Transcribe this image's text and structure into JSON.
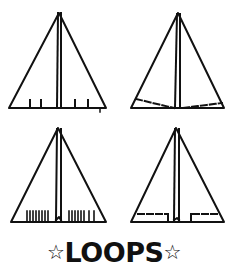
{
  "title": {
    "text": "LOOPS",
    "left_symbol": "☆",
    "right_symbol": "☆"
  },
  "diagrams": [
    {
      "id": 1,
      "description": "paper airplane with four short flap cuts at trailing edge"
    },
    {
      "id": 2,
      "description": "paper airplane with dashed diagonal fold lines at trailing edge"
    },
    {
      "id": 3,
      "description": "paper airplane with many closely spaced cuts at trailing edge"
    },
    {
      "id": 4,
      "description": "paper airplane with dashed rectangular flap fold lines at trailing edge"
    }
  ],
  "colors": {
    "ink": "#111111",
    "background": "#ffffff"
  }
}
